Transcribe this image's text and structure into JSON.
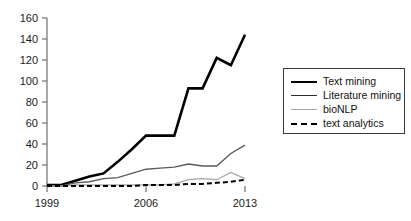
{
  "chart_data": {
    "type": "line",
    "title": "",
    "xlabel": "",
    "ylabel": "",
    "xlim": [
      1999,
      2013
    ],
    "ylim": [
      0,
      160
    ],
    "grid": false,
    "legend_position": "right",
    "x": [
      1999,
      2000,
      2001,
      2002,
      2003,
      2004,
      2005,
      2006,
      2007,
      2008,
      2009,
      2010,
      2011,
      2012,
      2013
    ],
    "xticks": [
      "1999",
      "2006",
      "2013"
    ],
    "xtick_values": [
      1999,
      2006,
      2013
    ],
    "yticks": [
      "0",
      "20",
      "40",
      "60",
      "80",
      "100",
      "120",
      "140",
      "160"
    ],
    "ytick_values": [
      0,
      20,
      40,
      60,
      80,
      100,
      120,
      140,
      160
    ],
    "series": [
      {
        "name": "Text mining",
        "style": "solid",
        "width": 2.6,
        "color": "#000000",
        "values": [
          1,
          1,
          5,
          9,
          12,
          23,
          35,
          48,
          48,
          48,
          93,
          93,
          122,
          115,
          144
        ]
      },
      {
        "name": "Literature mining",
        "style": "solid",
        "width": 1.4,
        "color": "#5a5a5a",
        "values": [
          0,
          0,
          3,
          4,
          7,
          8,
          12,
          16,
          17,
          18,
          21,
          19,
          19,
          31,
          39
        ]
      },
      {
        "name": "bioNLP",
        "style": "solid",
        "width": 1.2,
        "color": "#a6a6a6",
        "values": [
          0,
          0,
          1,
          1,
          1,
          1,
          1,
          1,
          1,
          2,
          6,
          7,
          6,
          13,
          7
        ]
      },
      {
        "name": "text analytics",
        "style": "dashed",
        "width": 2.0,
        "color": "#000000",
        "values": [
          0,
          0,
          0,
          0,
          0,
          0,
          0,
          1,
          1,
          1,
          2,
          2,
          3,
          4,
          6
        ]
      }
    ]
  },
  "legend": {
    "items": [
      {
        "label": "Text mining",
        "swatch": "solid-thick-line-icon"
      },
      {
        "label": "Literature mining",
        "swatch": "solid-medium-line-icon"
      },
      {
        "label": "bioNLP",
        "swatch": "solid-light-line-icon"
      },
      {
        "label": "text analytics",
        "swatch": "dashed-line-icon"
      }
    ]
  },
  "axes": {
    "y_labels": [
      "160",
      "140",
      "120",
      "100",
      "80",
      "60",
      "40",
      "20",
      "0"
    ],
    "x_labels": [
      "1999",
      "2006",
      "2013"
    ]
  },
  "colors": {
    "text_mining": "#000000",
    "literature_mining": "#5a5a5a",
    "bionlp": "#a6a6a6",
    "text_analytics": "#000000",
    "axis": "#6f6f6f",
    "background": "#ffffff"
  }
}
